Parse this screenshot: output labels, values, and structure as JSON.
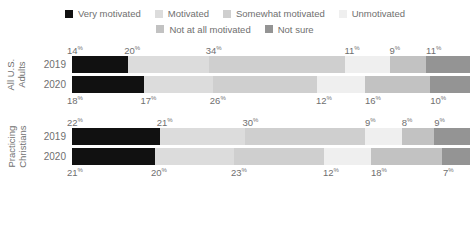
{
  "legend": {
    "rows": [
      [
        {
          "label": "Very motivated",
          "color": "#111111",
          "icon": "square-swatch"
        },
        {
          "label": "Motivated",
          "color": "#dcdcdc",
          "icon": "square-swatch"
        },
        {
          "label": "Somewhat motivated",
          "color": "#cfcfcf",
          "icon": "square-swatch"
        },
        {
          "label": "Unmotivated",
          "color": "#efefef",
          "icon": "square-swatch"
        }
      ],
      [
        {
          "label": "Not at all motivated",
          "color": "#c2c2c2",
          "icon": "square-swatch"
        },
        {
          "label": "Not sure",
          "color": "#949494",
          "icon": "square-swatch"
        }
      ]
    ]
  },
  "chart_data": {
    "type": "bar",
    "orientation": "horizontal",
    "stacked": true,
    "normalized_percent": true,
    "title": "",
    "xlabel": "",
    "ylabel": "",
    "xlim": [
      0,
      100
    ],
    "grid": false,
    "legend_position": "top",
    "categories": [
      "Very motivated",
      "Motivated",
      "Somewhat motivated",
      "Unmotivated",
      "Not at all motivated",
      "Not sure"
    ],
    "colors": [
      "#111111",
      "#dcdcdc",
      "#cfcfcf",
      "#efefef",
      "#c2c2c2",
      "#949494"
    ],
    "groups": [
      {
        "name": "All U.S. Adults",
        "title_line1": "All U.S.",
        "title_line2": "Adults",
        "rows": [
          {
            "year": "2019",
            "labels_position": "above",
            "values": [
              14,
              20,
              34,
              11,
              9,
              11
            ]
          },
          {
            "year": "2020",
            "labels_position": "below",
            "values": [
              18,
              17,
              26,
              12,
              16,
              10
            ]
          }
        ]
      },
      {
        "name": "Practicing Christians",
        "title_line1": "Practicing",
        "title_line2": "Christians",
        "rows": [
          {
            "year": "2019",
            "labels_position": "above",
            "values": [
              22,
              21,
              30,
              9,
              8,
              9
            ]
          },
          {
            "year": "2020",
            "labels_position": "below",
            "values": [
              21,
              20,
              23,
              12,
              18,
              7
            ]
          }
        ]
      }
    ]
  }
}
